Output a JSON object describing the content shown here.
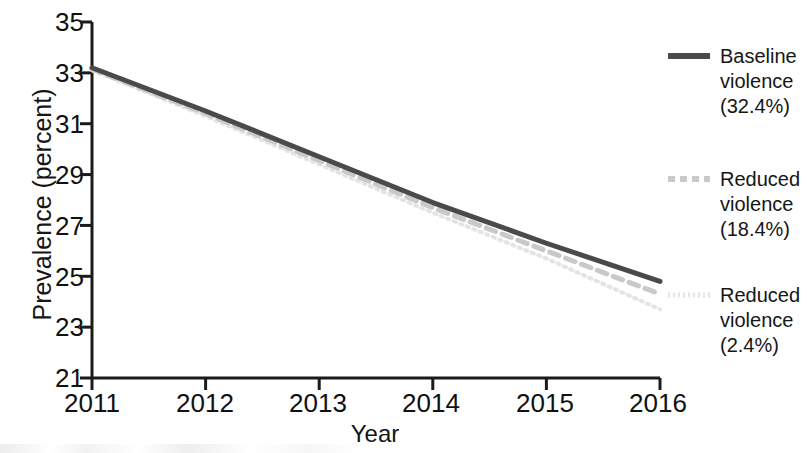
{
  "chart_data": {
    "type": "line",
    "title": "",
    "subtitle": "",
    "xlabel": "Year",
    "ylabel": "Prevalence (percent)",
    "x": [
      2011,
      2012,
      2013,
      2014,
      2015,
      2016
    ],
    "xticklabels": [
      "2011",
      "2012",
      "2013",
      "2014",
      "2015",
      "2016"
    ],
    "xlim": [
      2011,
      2016
    ],
    "ylim": [
      21,
      35
    ],
    "yticks": [
      21,
      23,
      25,
      27,
      29,
      31,
      33,
      35
    ],
    "yticklabels": [
      "21",
      "23",
      "25",
      "27",
      "29",
      "31",
      "33",
      "35"
    ],
    "grid": false,
    "legend_position": "right",
    "series": [
      {
        "name": "Baseline violence (32.4%)",
        "label_lines": [
          "Baseline",
          "violence",
          "(32.4%)"
        ],
        "values": [
          33.2,
          31.5,
          29.7,
          27.9,
          26.3,
          24.8
        ],
        "style": "solid",
        "color": "#4a4a4a",
        "width": 5
      },
      {
        "name": "Reduced violence (18.4%)",
        "label_lines": [
          "Reduced",
          "violence",
          "(18.4%)"
        ],
        "values": [
          33.15,
          31.4,
          29.55,
          27.7,
          26.0,
          24.3
        ],
        "style": "dashed",
        "color": "#c9c9c9",
        "width": 5
      },
      {
        "name": "Reduced violence (2.4%)",
        "label_lines": [
          "Reduced",
          "violence",
          "(2.4%)"
        ],
        "values": [
          33.1,
          31.3,
          29.4,
          27.5,
          25.7,
          23.7
        ],
        "style": "dotted",
        "color": "#e4e4e4",
        "width": 4
      }
    ]
  },
  "axes": {
    "y_title": "Prevalence (percent)",
    "x_title": "Year",
    "y_tick_labels": [
      "35",
      "33",
      "31",
      "29",
      "27",
      "25",
      "23",
      "21"
    ],
    "x_tick_labels": [
      "2011",
      "2012",
      "2013",
      "2014",
      "2015",
      "2016"
    ]
  },
  "legend": {
    "entries": [
      {
        "line1": "Baseline",
        "line2": "violence",
        "line3": "(32.4%)",
        "swatch": "solid-line-swatch",
        "color": "#4a4a4a"
      },
      {
        "line1": "Reduced",
        "line2": "violence",
        "line3": "(18.4%)",
        "swatch": "dashed-line-swatch",
        "color": "#c9c9c9"
      },
      {
        "line1": "Reduced",
        "line2": "violence",
        "line3": "(2.4%)",
        "swatch": "dotted-line-swatch",
        "color": "#e4e4e4"
      }
    ]
  }
}
